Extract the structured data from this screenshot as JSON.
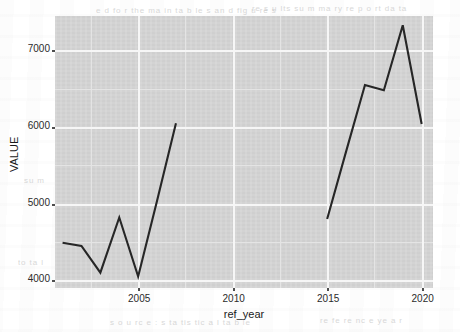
{
  "chart_data": {
    "type": "line",
    "title": "",
    "subtitle": "",
    "xlabel": "ref_year",
    "ylabel": "VALUE",
    "xlim": [
      2000.6,
      2020.6
    ],
    "ylim": [
      3900,
      7450
    ],
    "grid": true,
    "legend": "none",
    "line_color": "#262626",
    "panel_color": "#d4d4d4",
    "gridline_color": "#f6f6f6",
    "xticks": [
      2005,
      2010,
      2015,
      2020
    ],
    "xtick_labels": [
      "2005",
      "2010",
      "2015",
      "2020"
    ],
    "yticks": [
      4000,
      5000,
      6000,
      7000
    ],
    "ytick_labels": [
      "4000",
      "5000",
      "6000",
      "7000"
    ],
    "x_minor_ticks": [
      2002.5,
      2007.5,
      2012.5,
      2017.5
    ],
    "y_minor_ticks": [
      4500,
      5500,
      6500
    ],
    "series": [
      {
        "name": "VALUE",
        "x": [
          2001,
          2002,
          2003,
          2004,
          2005,
          2006,
          2007
        ],
        "values": [
          4490,
          4450,
          4100,
          4820,
          4050,
          5040,
          6050
        ]
      },
      {
        "name": "VALUE",
        "x": [
          2015,
          2016,
          2017,
          2018,
          2019,
          2020
        ],
        "values": [
          4800,
          5680,
          6550,
          6480,
          7330,
          6040
        ]
      }
    ]
  },
  "background": {
    "ghost_lines": [
      {
        "text": "e d  fo r  the  ma in  ta b le s  an d  fig u re s",
        "x": 96,
        "y": 6
      },
      {
        "text": "re s u lts  su m ma ry  re p o rt  da ta",
        "x": 252,
        "y": 4
      },
      {
        "text": "an nu a l  ch an ge  in  to ta l",
        "x": 208,
        "y": 128
      },
      {
        "text": "va lu e s  a re  ro un de d",
        "x": 300,
        "y": 126
      },
      {
        "text": "ta b le  3",
        "x": 196,
        "y": 198
      },
      {
        "text": "p ro v in c e",
        "x": 254,
        "y": 196
      },
      {
        "text": "n o te",
        "x": 310,
        "y": 200
      },
      {
        "text": "s o u rc e  :  s ta tis tic a l  ta b le",
        "x": 110,
        "y": 318
      },
      {
        "text": "re fe re nc e  ye a r",
        "x": 320,
        "y": 316
      },
      {
        "text": "su m",
        "x": 24,
        "y": 176
      },
      {
        "text": "to ta l",
        "x": 18,
        "y": 258
      }
    ]
  }
}
